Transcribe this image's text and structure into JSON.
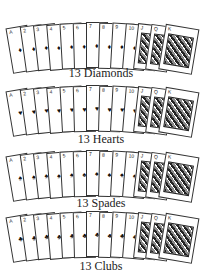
{
  "rows": [
    {
      "label": "13 Diamonds",
      "suit_symbol": "♦",
      "top": 20,
      "label_top": 66
    },
    {
      "label": "13 Hearts",
      "suit_symbol": "♥",
      "top": 83,
      "label_top": 132
    },
    {
      "label": "13 Spades",
      "suit_symbol": "♠",
      "top": 148,
      "label_top": 196
    },
    {
      "label": "13 Clubs",
      "suit_symbol": "♣",
      "top": 209,
      "label_top": 259
    }
  ],
  "ranks": [
    "A",
    "2",
    "3",
    "4",
    "5",
    "6",
    "7",
    "8",
    "9",
    "10",
    "J",
    "Q",
    "K"
  ]
}
